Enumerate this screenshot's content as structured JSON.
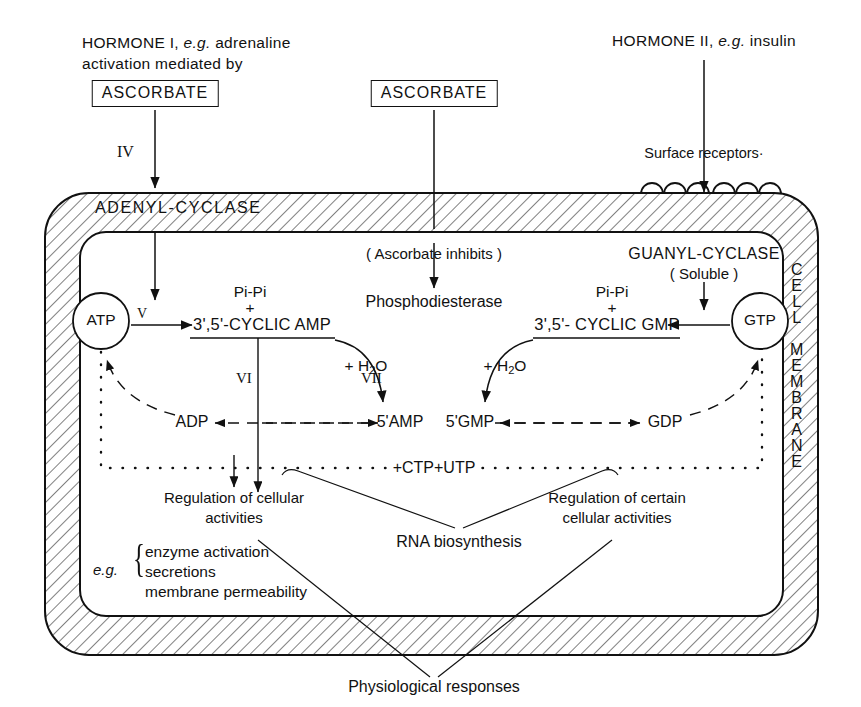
{
  "figure": {
    "type": "biochemical-pathway-diagram"
  },
  "top_labels": {
    "hormone_i_line1_a": "HORMONE I,",
    "hormone_i_line1_b": "e.g.",
    "hormone_i_line1_c": "adrenaline",
    "hormone_i_line2": "activation mediated by",
    "ascorbate_left": "ASCORBATE",
    "ascorbate_middle": "ASCORBATE",
    "hormone_ii_a": "HORMONE II,",
    "hormone_ii_b": "e.g.",
    "hormone_ii_c": "insulin",
    "surface_receptors": "Surface  receptors·"
  },
  "membrane": {
    "adenyl_cyclase": "ADENYL-CYCLASE",
    "cell_membrane_letters": [
      "C",
      "E",
      "L",
      "L",
      "",
      "M",
      "E",
      "M",
      "B",
      "R",
      "A",
      "N",
      "E"
    ],
    "cell_word": "CELL",
    "membrane_word": "MEMBRANE"
  },
  "roman_numerals": {
    "iv": "IV",
    "v": "V",
    "vi": "VI",
    "vii": "VII"
  },
  "interior": {
    "ascorbate_inhibits": "( Ascorbate  inhibits )",
    "phosphodiesterase": "Phosphodiesterase",
    "guanyl_cyclase": "GUANYL-CYCLASE",
    "guanyl_soluble": "( Soluble )",
    "atp": "ATP",
    "gtp": "GTP",
    "pi_pi_left": "Pi-Pi",
    "plus_left": "+",
    "cyclic_amp": "3',5'-CYCLIC AMP",
    "pi_pi_right": "Pi-Pi",
    "plus_right": "+",
    "cyclic_gmp": "3',5'- CYCLIC GMP",
    "water_left": "+ H",
    "water_left_sub": "2",
    "water_left_end": "O",
    "water_right": "+ H",
    "water_right_sub": "2",
    "water_right_end": "O",
    "adp": "ADP",
    "amp5": "5'AMP",
    "gmp5": "5'GMP",
    "gdp": "GDP",
    "ctp_utp": "+CTP+UTP"
  },
  "outputs": {
    "regulation_left_line1": "Regulation of cellular",
    "regulation_left_line2": "activities",
    "regulation_right_line1": "Regulation of certain",
    "regulation_right_line2": "cellular activities",
    "rna_biosynthesis": "RNA biosynthesis",
    "eg": "e.g.",
    "eg_item1": "enzyme activation",
    "eg_item2": "secretions",
    "eg_item3": "membrane permeability",
    "physiological_responses": "Physiological responses"
  },
  "colors": {
    "ink": "#111111",
    "paper": "#ffffff",
    "hatch": "#555555"
  }
}
